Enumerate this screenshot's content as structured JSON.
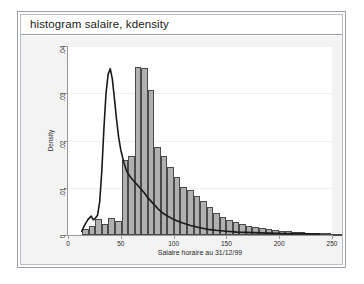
{
  "window": {
    "title": "histogram salaire, kdensity"
  },
  "chart_data": {
    "type": "bar",
    "title": "",
    "xlabel": "Salaire horaire au 31/12/99",
    "ylabel": "Density",
    "xlim": [
      0,
      250
    ],
    "ylim": [
      0,
      0.04
    ],
    "xticks": [
      0,
      50,
      100,
      150,
      200,
      250
    ],
    "xtick_labels": [
      "0",
      "50",
      "100",
      "150",
      "200",
      "250"
    ],
    "yticks": [
      0,
      0.01,
      0.02,
      0.03,
      0.04
    ],
    "ytick_labels": [
      "0",
      ".01",
      ".02",
      ".03",
      ".04"
    ],
    "grid": true,
    "legend": null,
    "bar_color": "#b0b0b0",
    "bar_edge_color": "#4a4a4a",
    "line_color": "#1a1a1a",
    "bin_width": 6.2,
    "bin_start": 13.5,
    "bin_heights": [
      0.0012,
      0.0019,
      0.0034,
      0.0023,
      0.0037,
      0.003,
      0.0158,
      0.0167,
      0.0355,
      0.0353,
      0.0307,
      0.0186,
      0.0167,
      0.0143,
      0.0122,
      0.0102,
      0.0095,
      0.0083,
      0.0073,
      0.006,
      0.0046,
      0.0038,
      0.0032,
      0.0027,
      0.0024,
      0.002,
      0.0016,
      0.0014,
      0.0012,
      0.0011,
      0.0009,
      0.0008,
      0.0007,
      0.0006,
      0.0005,
      0.0005,
      0.0004,
      0.0004,
      0.0003,
      0.0003,
      0.0002
    ],
    "density_curve": {
      "name": "kdensity",
      "x": [
        13,
        16,
        19,
        22,
        24,
        26,
        28,
        30,
        32,
        34,
        36,
        38,
        40,
        42,
        44,
        46,
        48,
        50,
        53,
        56,
        60,
        64,
        68,
        72,
        76,
        80,
        85,
        90,
        95,
        100,
        108,
        116,
        124,
        132,
        140,
        150,
        160,
        175,
        190,
        205,
        220,
        238
      ],
      "y": [
        0.0008,
        0.0022,
        0.0033,
        0.004,
        0.0032,
        0.0036,
        0.0042,
        0.007,
        0.0135,
        0.0225,
        0.03,
        0.034,
        0.0352,
        0.033,
        0.0288,
        0.0244,
        0.0206,
        0.018,
        0.0152,
        0.0133,
        0.012,
        0.011,
        0.01,
        0.009,
        0.0078,
        0.0068,
        0.0056,
        0.0046,
        0.0039,
        0.0033,
        0.0026,
        0.002,
        0.0016,
        0.0012,
        0.001,
        0.0008,
        0.0006,
        0.0005,
        0.0004,
        0.0003,
        0.0003,
        0.0002
      ]
    }
  }
}
